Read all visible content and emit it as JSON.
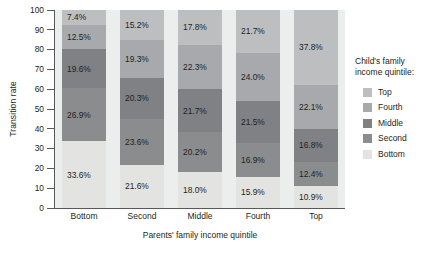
{
  "chart_data": {
    "type": "bar",
    "subtype": "stacked-100-percent",
    "title": "",
    "xlabel": "Parents' family income quintile",
    "ylabel": "Transition rate",
    "categories": [
      "Bottom",
      "Second",
      "Middle",
      "Fourth",
      "Top"
    ],
    "ylim": [
      0,
      100
    ],
    "yticks": [
      0,
      10,
      20,
      30,
      40,
      50,
      60,
      70,
      80,
      90,
      100
    ],
    "grid": false,
    "legend_position": "right",
    "legend_title": "Child's family income quintile:",
    "legend_order": [
      "Top",
      "Fourth",
      "Middle",
      "Second",
      "Bottom"
    ],
    "stack_order_bottom_to_top": [
      "Bottom",
      "Second",
      "Middle",
      "Fourth",
      "Top"
    ],
    "series": [
      {
        "name": "Bottom",
        "color": "#e3e3e2",
        "values": [
          33.6,
          21.6,
          18.0,
          15.9,
          10.9
        ],
        "labels": [
          "33.6%",
          "21.6%",
          "18.0%",
          "15.9%",
          "10.9%"
        ]
      },
      {
        "name": "Second",
        "color": "#8b8c8e",
        "values": [
          26.9,
          23.6,
          20.2,
          16.9,
          12.4
        ],
        "labels": [
          "26.9%",
          "23.6%",
          "20.2%",
          "16.9%",
          "12.4%"
        ]
      },
      {
        "name": "Middle",
        "color": "#7f8184",
        "values": [
          19.6,
          20.3,
          21.7,
          21.5,
          16.8
        ],
        "labels": [
          "19.6%",
          "20.3%",
          "21.7%",
          "21.5%",
          "16.8%"
        ]
      },
      {
        "name": "Fourth",
        "color": "#a7a9ac",
        "values": [
          12.5,
          19.3,
          22.3,
          24.0,
          22.1
        ],
        "labels": [
          "12.5%",
          "19.3%",
          "22.3%",
          "24.0%",
          "22.1%"
        ]
      },
      {
        "name": "Top",
        "color": "#bcbec0",
        "values": [
          7.4,
          15.2,
          17.8,
          21.7,
          37.8
        ],
        "labels": [
          "7.4%",
          "15.2%",
          "17.8%",
          "21.7%",
          "37.8%"
        ]
      }
    ]
  },
  "axis": {
    "y_title": "Transition rate",
    "x_title": "Parents' family income quintile",
    "y_tick_labels": [
      "100",
      "90",
      "80",
      "70",
      "60",
      "50",
      "40",
      "30",
      "20",
      "10",
      "0"
    ]
  },
  "legend": {
    "title_line1": "Child's family",
    "title_line2": "income quintile:",
    "items": [
      {
        "label": "Top",
        "color": "#bcbec0"
      },
      {
        "label": "Fourth",
        "color": "#a7a9ac"
      },
      {
        "label": "Middle",
        "color": "#7f8184"
      },
      {
        "label": "Second",
        "color": "#8b8c8e"
      },
      {
        "label": "Bottom",
        "color": "#e3e3e2"
      }
    ]
  },
  "colors": {
    "plot_background": "#eceded",
    "axis_line": "#58585b",
    "text": "#231f20",
    "page_background": "#ffffff"
  }
}
